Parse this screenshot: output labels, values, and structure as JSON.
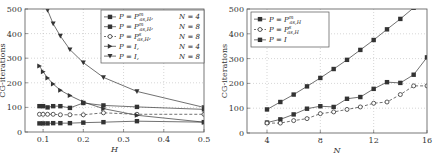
{
  "chart_data": [
    {
      "type": "line",
      "title": "",
      "xlabel": "H",
      "ylabel": "CG-iterations",
      "xlim": [
        0.055,
        0.5
      ],
      "ylim": [
        0,
        500
      ],
      "xticks": [
        0.1,
        0.2,
        0.3,
        0.4,
        0.5
      ],
      "xtick_labels": [
        "0.1",
        "0.2",
        "0.3",
        "0.4",
        "0.5"
      ],
      "yticks": [
        0,
        100,
        200,
        300,
        400,
        500
      ],
      "ytick_labels": [
        "0",
        "100",
        "200",
        "300",
        "400",
        "500"
      ],
      "grid": true,
      "legend_position": "upper right",
      "series": [
        {
          "name": "P = P^m_{as,H}, N = 4",
          "marker": "square",
          "dash": "solid",
          "x": [
            0.0909,
            0.1,
            0.1111,
            0.125,
            0.1429,
            0.1667,
            0.2,
            0.25,
            0.3333,
            0.5
          ],
          "y": [
            35,
            35,
            35,
            36,
            36,
            36,
            38,
            40,
            44,
            40
          ]
        },
        {
          "name": "P = P^m_{as,H}, N = 8",
          "marker": "square",
          "dash": "solid",
          "x": [
            0.0909,
            0.1,
            0.1111,
            0.125,
            0.1429,
            0.1667,
            0.2,
            0.25,
            0.3333,
            0.5
          ],
          "y": [
            105,
            105,
            100,
            105,
            105,
            98,
            118,
            108,
            102,
            92
          ]
        },
        {
          "name": "P = P^s_{as,H}, N = 8",
          "marker": "circle",
          "dash": "dashed",
          "x": [
            0.0909,
            0.1,
            0.1111,
            0.125,
            0.1429,
            0.1667,
            0.2,
            0.25,
            0.3333,
            0.5
          ],
          "y": [
            72,
            72,
            72,
            72,
            70,
            70,
            70,
            78,
            72,
            72
          ]
        },
        {
          "name": "P = I, N = 4",
          "marker": "triangle-right",
          "dash": "solid",
          "x": [
            0.0909,
            0.1,
            0.1111,
            0.125,
            0.1429,
            0.1667,
            0.2,
            0.25,
            0.3333,
            0.5
          ],
          "y": [
            268,
            245,
            220,
            195,
            170,
            148,
            122,
            95,
            68,
            40
          ]
        },
        {
          "name": "P = I, N = 8",
          "marker": "triangle-down",
          "dash": "solid",
          "x": [
            0.0909,
            0.1111,
            0.125,
            0.1429,
            0.1667,
            0.2,
            0.25,
            0.3333,
            0.5
          ],
          "y": [
            560,
            495,
            440,
            390,
            335,
            282,
            222,
            165,
            100
          ]
        }
      ]
    },
    {
      "type": "line",
      "title": "",
      "xlabel": "N",
      "ylabel": "CG-iterations",
      "xlim": [
        2.5,
        16
      ],
      "ylim": [
        0,
        500
      ],
      "xticks": [
        4,
        8,
        12,
        16
      ],
      "xtick_labels": [
        "4",
        "8",
        "12",
        "16"
      ],
      "yticks": [
        0,
        100,
        200,
        300,
        400,
        500
      ],
      "ytick_labels": [
        "0",
        "100",
        "200",
        "300",
        "400",
        "500"
      ],
      "grid": true,
      "legend_position": "upper left",
      "series": [
        {
          "name": "P = P^m_{as,H}",
          "marker": "square",
          "dash": "solid",
          "x": [
            4,
            5,
            6,
            7,
            8,
            9,
            10,
            11,
            12,
            13,
            14,
            15,
            16
          ],
          "y": [
            42,
            55,
            75,
            98,
            108,
            105,
            138,
            145,
            178,
            205,
            202,
            235,
            305
          ]
        },
        {
          "name": "P = P^s_{as,H}",
          "marker": "circle",
          "dash": "dashed",
          "x": [
            4,
            5,
            6,
            7,
            8,
            9,
            10,
            11,
            12,
            13,
            14,
            15,
            16
          ],
          "y": [
            40,
            40,
            50,
            58,
            78,
            85,
            95,
            105,
            120,
            125,
            155,
            190,
            190
          ]
        },
        {
          "name": "P = I",
          "marker": "square",
          "dash": "solid",
          "x": [
            4,
            5,
            6,
            7,
            8,
            9,
            10,
            11,
            12,
            13,
            14,
            15,
            16
          ],
          "y": [
            95,
            125,
            155,
            188,
            222,
            258,
            295,
            335,
            375,
            418,
            460,
            505,
            550
          ]
        }
      ]
    }
  ],
  "left_legend": [
    {
      "label": "P = P",
      "sup": "m",
      "sub": "as,H",
      "tail": ", ",
      "n": "N = 4"
    },
    {
      "label": "P = P",
      "sup": "m",
      "sub": "as,H",
      "tail": ", ",
      "n": "N = 8"
    },
    {
      "label": "P = P",
      "sup": "s",
      "sub": "as,H",
      "tail": ", ",
      "n": "N = 8"
    },
    {
      "label": "P = I,",
      "sup": "",
      "sub": "",
      "tail": "",
      "n": "N = 4"
    },
    {
      "label": "P = I,",
      "sup": "",
      "sub": "",
      "tail": "",
      "n": "N = 8"
    }
  ],
  "right_legend": [
    {
      "label": "P = P",
      "sup": "m",
      "sub": "as,H"
    },
    {
      "label": "P = P",
      "sup": "s",
      "sub": "as,H"
    },
    {
      "label": "P = I",
      "sup": "",
      "sub": ""
    }
  ],
  "colors": {
    "line": "#333333",
    "grid": "#bbbbbb",
    "frame": "#555555"
  }
}
